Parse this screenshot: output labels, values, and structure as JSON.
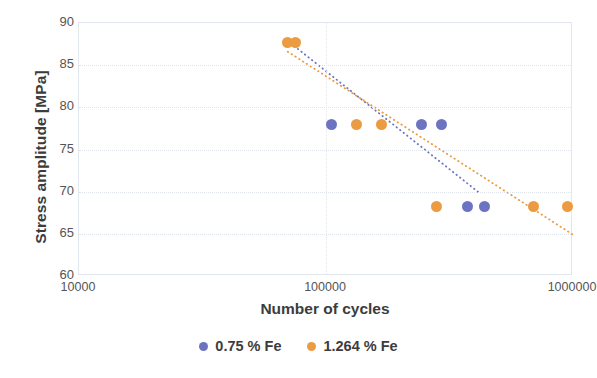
{
  "chart_data": {
    "type": "scatter",
    "title": "",
    "xlabel": "Number of cycles",
    "ylabel": "Stress amplitude [MPa]",
    "x_scale": "log",
    "xlim": [
      10000,
      1000000
    ],
    "ylim": [
      60,
      90
    ],
    "y_ticks": [
      90,
      85,
      80,
      75,
      70,
      65,
      60
    ],
    "x_ticks": [
      10000,
      100000,
      1000000
    ],
    "x_tick_labels": [
      "10000",
      "100000",
      "1000000"
    ],
    "grid": true,
    "legend_position": "bottom",
    "series": [
      {
        "name": "0.75 % Fe",
        "color": "#6c74c2",
        "points": [
          {
            "x": 105000,
            "y": 78.0
          },
          {
            "x": 244000,
            "y": 78.0
          },
          {
            "x": 294000,
            "y": 78.0
          },
          {
            "x": 375000,
            "y": 68.3
          },
          {
            "x": 440000,
            "y": 68.3
          }
        ],
        "trendline": {
          "x_start": 72000,
          "y_start": 87.6,
          "x_end": 420000,
          "y_end": 69.8,
          "style": "dotted"
        }
      },
      {
        "name": "1.264 % Fe",
        "color": "#eb9b41",
        "points": [
          {
            "x": 70000,
            "y": 87.7
          },
          {
            "x": 75000,
            "y": 87.7
          },
          {
            "x": 133000,
            "y": 78.0
          },
          {
            "x": 168000,
            "y": 78.0
          },
          {
            "x": 280000,
            "y": 68.3
          },
          {
            "x": 690000,
            "y": 68.3
          },
          {
            "x": 950000,
            "y": 68.3
          }
        ],
        "trendline": {
          "x_start": 70000,
          "y_start": 86.6,
          "x_end": 1000000,
          "y_end": 64.9,
          "style": "dotted"
        }
      }
    ]
  },
  "legend": {
    "items": [
      {
        "label": "0.75 % Fe",
        "color": "#6c74c2"
      },
      {
        "label": "1.264 % Fe",
        "color": "#eb9b41"
      }
    ]
  },
  "axes": {
    "y_title": "Stress amplitude [MPa]",
    "x_title": "Number of cycles"
  }
}
